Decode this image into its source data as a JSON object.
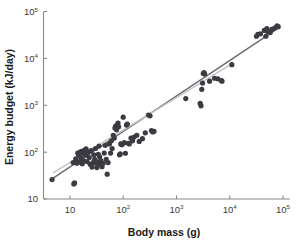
{
  "figure": {
    "background": "#ffffff",
    "width": 296,
    "height": 242
  },
  "axes": {
    "x": {
      "title": "Body mass (g)",
      "scale": "log",
      "range": [
        4,
        100000
      ],
      "tick_values": [
        10,
        100,
        1000,
        10000,
        100000
      ],
      "tick_labels": [
        {
          "base": "10",
          "exp": ""
        },
        {
          "base": "10",
          "exp": "2"
        },
        {
          "base": "10",
          "exp": "3"
        },
        {
          "base": "10",
          "exp": "4"
        },
        {
          "base": "10",
          "exp": "5"
        }
      ]
    },
    "y": {
      "title": "Energy budget (kJ/day)",
      "scale": "log",
      "range": [
        10,
        100000
      ],
      "tick_values": [
        10,
        100,
        1000,
        10000,
        100000
      ],
      "tick_labels": [
        {
          "base": "10",
          "exp": ""
        },
        {
          "base": "10",
          "exp": "2"
        },
        {
          "base": "10",
          "exp": "3"
        },
        {
          "base": "10",
          "exp": "4"
        },
        {
          "base": "10",
          "exp": "5"
        }
      ]
    }
  },
  "style": {
    "marker_color": "#3b3b42",
    "marker_radius": 2.6,
    "axis_color": "#8a8a8a",
    "text_color": "#1a1a1a",
    "line_dark": "#6e6e73",
    "line_light": "#c4c4c6"
  },
  "chart_data": {
    "type": "scatter",
    "title": "",
    "xlabel": "Body mass (g)",
    "ylabel": "Energy budget (kJ/day)",
    "xscale": "log",
    "yscale": "log",
    "xlim": [
      4,
      100000
    ],
    "ylim": [
      10,
      100000
    ],
    "grid": false,
    "legend": "none",
    "series": [
      {
        "name": "Species energy budget",
        "marker": "circle",
        "color": "#3b3b42",
        "points": [
          [
            4.6,
            26
          ],
          [
            11.5,
            60
          ],
          [
            11.8,
            21
          ],
          [
            12.2,
            22
          ],
          [
            12.8,
            72
          ],
          [
            13.5,
            58
          ],
          [
            14.0,
            96
          ],
          [
            14.5,
            88
          ],
          [
            15.0,
            62
          ],
          [
            15.5,
            100
          ],
          [
            16.0,
            76
          ],
          [
            16.5,
            104
          ],
          [
            17.0,
            57
          ],
          [
            17.5,
            95
          ],
          [
            18.0,
            66
          ],
          [
            18.5,
            110
          ],
          [
            19.0,
            99
          ],
          [
            19.5,
            86
          ],
          [
            20.0,
            118
          ],
          [
            20.5,
            92
          ],
          [
            21.0,
            63
          ],
          [
            22.0,
            101
          ],
          [
            23.0,
            77
          ],
          [
            24.0,
            55
          ],
          [
            25.0,
            108
          ],
          [
            26.0,
            48
          ],
          [
            27.0,
            60
          ],
          [
            28.0,
            88
          ],
          [
            29.0,
            70
          ],
          [
            30.0,
            120
          ],
          [
            31.0,
            58
          ],
          [
            32.0,
            47
          ],
          [
            33.0,
            62
          ],
          [
            34.0,
            90
          ],
          [
            35.0,
            135
          ],
          [
            36.0,
            80
          ],
          [
            37.0,
            55
          ],
          [
            38.0,
            66
          ],
          [
            40.0,
            49
          ],
          [
            42.0,
            58
          ],
          [
            44.0,
            96
          ],
          [
            46.0,
            140
          ],
          [
            48.0,
            70
          ],
          [
            50.0,
            34
          ],
          [
            52.0,
            60
          ],
          [
            55.0,
            150
          ],
          [
            58.0,
            96
          ],
          [
            60.0,
            175
          ],
          [
            62.0,
            120
          ],
          [
            65.0,
            230
          ],
          [
            68.0,
            200
          ],
          [
            70.0,
            330
          ],
          [
            72.0,
            360
          ],
          [
            75.0,
            300
          ],
          [
            78.0,
            390
          ],
          [
            80.0,
            420
          ],
          [
            82.0,
            350
          ],
          [
            85.0,
            88
          ],
          [
            88.0,
            92
          ],
          [
            90.0,
            150
          ],
          [
            95.0,
            145
          ],
          [
            100.0,
            560
          ],
          [
            105.0,
            160
          ],
          [
            110.0,
            95
          ],
          [
            115.0,
            380
          ],
          [
            120.0,
            400
          ],
          [
            125.0,
            155
          ],
          [
            130.0,
            150
          ],
          [
            140.0,
            200
          ],
          [
            150.0,
            175
          ],
          [
            160.0,
            210
          ],
          [
            180.0,
            230
          ],
          [
            200.0,
            170
          ],
          [
            230.0,
            195
          ],
          [
            260.0,
            260
          ],
          [
            300.0,
            620
          ],
          [
            320.0,
            600
          ],
          [
            340.0,
            290
          ],
          [
            360.0,
            270
          ],
          [
            380.0,
            280
          ],
          [
            1500.0,
            1400
          ],
          [
            2800.0,
            1100
          ],
          [
            2900.0,
            980
          ],
          [
            3000.0,
            2200
          ],
          [
            3100.0,
            3000
          ],
          [
            3200.0,
            4800
          ],
          [
            3300.0,
            5000
          ],
          [
            3400.0,
            4700
          ],
          [
            4200.0,
            3300
          ],
          [
            5200.0,
            3800
          ],
          [
            6000.0,
            3700
          ],
          [
            7000.0,
            3400
          ],
          [
            7200.0,
            3300
          ],
          [
            11000.0,
            7400
          ],
          [
            32000.0,
            30000
          ],
          [
            34000.0,
            33000
          ],
          [
            38000.0,
            34000
          ],
          [
            45000.0,
            40000
          ],
          [
            48000.0,
            30000
          ],
          [
            50000.0,
            44000
          ],
          [
            52000.0,
            38000
          ],
          [
            58000.0,
            36000
          ],
          [
            62000.0,
            42000
          ],
          [
            70000.0,
            45000
          ],
          [
            78000.0,
            50000
          ],
          [
            82000.0,
            48000
          ]
        ]
      }
    ],
    "fit_lines": [
      {
        "name": "regression-line-dark",
        "color": "#6e6e73",
        "width": 1.5,
        "x_start": 4.6,
        "y_start": 27,
        "x_end": 88000,
        "y_end": 47000
      },
      {
        "name": "regression-line-light",
        "color": "#c4c4c6",
        "width": 1.5,
        "x_start": 4.8,
        "y_start": 36,
        "x_end": 12000,
        "y_end": 8200
      }
    ]
  }
}
